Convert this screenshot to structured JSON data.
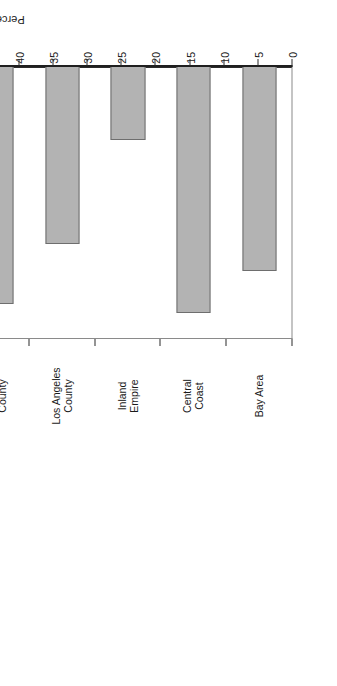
{
  "chart_data": {
    "type": "bar",
    "orientation": "horizontal",
    "title": "",
    "subtitle": "",
    "xlabel": "",
    "ylabel": "Percentage",
    "value_axis_label": "Percentage",
    "categories": [
      "Bay Area",
      "Central Coast",
      "Inland Empire",
      "Los Angeles County",
      "Orange County",
      "Sacramento Metro",
      "San Diego",
      "San Joaquin Valley",
      "State Total"
    ],
    "category_lines": [
      [
        "Bay Area"
      ],
      [
        "Central",
        "Coast"
      ],
      [
        "Inland",
        "Empire"
      ],
      [
        "Los Angeles",
        "County"
      ],
      [
        "Orange",
        "County"
      ],
      [
        "Sacramento",
        "Metro"
      ],
      [
        "San Diego"
      ],
      [
        "San Joaquin",
        "Valley"
      ],
      [
        "State Total"
      ]
    ],
    "values": [
      30.1,
      36.2,
      10.9,
      26.1,
      34.8,
      20.4,
      14.9,
      20.0,
      24.4
    ],
    "ylim": [
      0,
      40
    ],
    "value_ticks": [
      0,
      5,
      10,
      15,
      20,
      25,
      30,
      35,
      40
    ],
    "tick_labels": [
      "0",
      "5",
      "10",
      "15",
      "20",
      "25",
      "30",
      "35",
      "40"
    ],
    "grid": false,
    "legend": null,
    "bar_fill_color": "#b3b3b3",
    "bar_edge_color": "#6e6e6e",
    "axis_color": "#1f1f1f",
    "background_color": "#ffffff",
    "text_rotation_degrees": 180,
    "figure_rotation_degrees": 90
  }
}
